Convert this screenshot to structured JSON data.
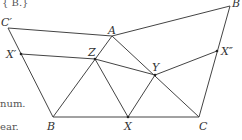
{
  "fragments": {
    "top": "{ B.}",
    "mid": "num.",
    "bottom": "ear."
  },
  "points": {
    "Cprime": {
      "label": "C′",
      "x": 8,
      "y": 28
    },
    "A": {
      "label": "A",
      "x": 112,
      "y": 36
    },
    "Btop": {
      "label": "B",
      "x": 230,
      "y": 6
    },
    "Xprime": {
      "label": "X′",
      "x": 21,
      "y": 54
    },
    "Z": {
      "label": "Z",
      "x": 95,
      "y": 59
    },
    "Y": {
      "label": "Y",
      "x": 155,
      "y": 75
    },
    "Xdouble": {
      "label": "X″",
      "x": 217,
      "y": 51
    },
    "B": {
      "label": "B",
      "x": 53,
      "y": 117
    },
    "X": {
      "label": "X",
      "x": 128,
      "y": 117
    },
    "C": {
      "label": "C",
      "x": 199,
      "y": 117
    }
  },
  "colors": {
    "stroke": "#444444",
    "text": "#333333"
  }
}
